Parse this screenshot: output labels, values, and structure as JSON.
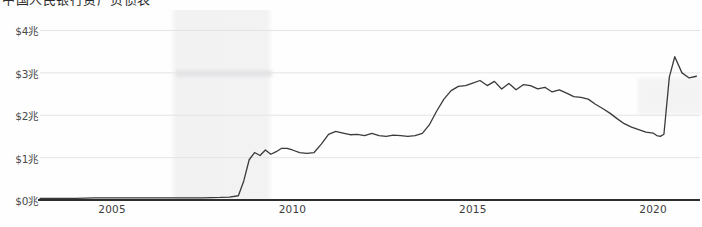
{
  "figure": {
    "title_partial": "中国人民银行资产负债表",
    "background_color": "#fefefe"
  },
  "chart_data": {
    "type": "line",
    "title": "中国人民银行资产负债表",
    "xlabel": "",
    "ylabel": "",
    "grid": true,
    "legend_position": "none",
    "line_color": "#3a3a3a",
    "axis_color": "#2e2e2e",
    "gridline_color": "#e4e4e4",
    "xlim": [
      2003.0,
      2021.3
    ],
    "ylim": [
      0,
      4.2
    ],
    "y_tick_labels": [
      "$4兆",
      "$3兆",
      "$2兆",
      "$1兆",
      "$0兆"
    ],
    "y_tick_values": [
      4,
      3,
      2,
      1,
      0
    ],
    "x_tick_labels": [
      "2005",
      "2010",
      "2015",
      "2020"
    ],
    "x_tick_values": [
      2005,
      2010,
      2015,
      2020
    ],
    "units": "兆 (trillion USD)",
    "series": [
      {
        "name": "资产负债表规模",
        "x": [
          2003.0,
          2003.5,
          2004.0,
          2004.5,
          2005.0,
          2005.5,
          2006.0,
          2006.5,
          2007.0,
          2007.5,
          2008.0,
          2008.25,
          2008.5,
          2008.65,
          2008.8,
          2008.95,
          2009.1,
          2009.25,
          2009.4,
          2009.55,
          2009.7,
          2009.85,
          2010.0,
          2010.2,
          2010.4,
          2010.6,
          2010.8,
          2011.0,
          2011.2,
          2011.4,
          2011.6,
          2011.8,
          2012.0,
          2012.2,
          2012.4,
          2012.6,
          2012.8,
          2013.0,
          2013.2,
          2013.4,
          2013.6,
          2013.8,
          2014.0,
          2014.2,
          2014.4,
          2014.6,
          2014.8,
          2015.0,
          2015.2,
          2015.4,
          2015.6,
          2015.8,
          2016.0,
          2016.2,
          2016.4,
          2016.6,
          2016.8,
          2017.0,
          2017.2,
          2017.4,
          2017.6,
          2017.8,
          2018.0,
          2018.2,
          2018.4,
          2018.6,
          2018.8,
          2019.0,
          2019.2,
          2019.4,
          2019.6,
          2019.8,
          2020.0,
          2020.1,
          2020.2,
          2020.3,
          2020.45,
          2020.6,
          2020.8,
          2021.0,
          2021.2
        ],
        "y": [
          0.04,
          0.04,
          0.04,
          0.05,
          0.05,
          0.05,
          0.05,
          0.05,
          0.05,
          0.05,
          0.06,
          0.07,
          0.1,
          0.45,
          0.95,
          1.12,
          1.05,
          1.18,
          1.08,
          1.14,
          1.22,
          1.22,
          1.18,
          1.12,
          1.1,
          1.12,
          1.32,
          1.55,
          1.62,
          1.58,
          1.54,
          1.55,
          1.52,
          1.57,
          1.52,
          1.5,
          1.53,
          1.52,
          1.5,
          1.52,
          1.57,
          1.78,
          2.1,
          2.38,
          2.58,
          2.68,
          2.7,
          2.76,
          2.82,
          2.7,
          2.8,
          2.62,
          2.75,
          2.6,
          2.72,
          2.7,
          2.62,
          2.66,
          2.55,
          2.6,
          2.52,
          2.44,
          2.42,
          2.38,
          2.26,
          2.16,
          2.05,
          1.92,
          1.8,
          1.72,
          1.66,
          1.6,
          1.58,
          1.52,
          1.5,
          1.55,
          2.9,
          3.38,
          3.0,
          2.88,
          2.92
        ]
      }
    ]
  }
}
